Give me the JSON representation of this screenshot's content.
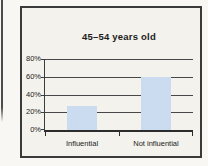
{
  "chart_data": {
    "type": "bar",
    "title": "45–54 years old",
    "categories": [
      "Influential",
      "Not influential"
    ],
    "values": [
      27,
      60
    ],
    "xlabel": "",
    "ylabel": "",
    "ylim": [
      0,
      80
    ],
    "yticks": [
      0,
      20,
      40,
      60,
      80
    ],
    "ytick_labels": [
      "0%",
      "20%",
      "40%",
      "60%",
      "80%"
    ],
    "grid": true,
    "legend": false,
    "bar_color": "#cbdcf1",
    "background_color": "#f3f2ed",
    "border_color": "#3a3a3a",
    "gridline_color": "#474747",
    "text_color": "#1c1c1c"
  }
}
